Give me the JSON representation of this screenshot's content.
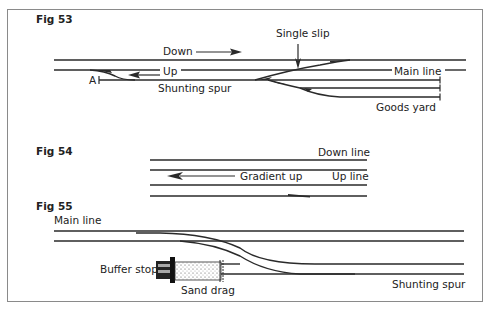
{
  "figures": [
    {
      "id": "fig53",
      "title": "Fig 53",
      "labels": {
        "down": "Down",
        "up": "Up",
        "single_slip": "Single slip",
        "main_line": "Main line",
        "point_a": "A",
        "shunting_spur": "Shunting spur",
        "goods_yard": "Goods yard"
      },
      "arrows": [
        {
          "label": "Down",
          "direction": "right"
        },
        {
          "label": "Up",
          "direction": "left"
        },
        {
          "label": "Single slip",
          "direction": "down"
        }
      ]
    },
    {
      "id": "fig54",
      "title": "Fig 54",
      "labels": {
        "down_line": "Down line",
        "gradient_up": "Gradient up",
        "up_line": "Up line"
      },
      "arrows": [
        {
          "label": "Gradient up",
          "direction": "left"
        }
      ]
    },
    {
      "id": "fig55",
      "title": "Fig 55",
      "labels": {
        "main_line": "Main line",
        "buffer_stop": "Buffer stop",
        "sand_drag": "Sand drag",
        "shunting_spur": "Shunting spur"
      }
    }
  ],
  "colors": {
    "line": "#2a2a2a",
    "border": "#8a8a8a",
    "background": "#ffffff"
  }
}
